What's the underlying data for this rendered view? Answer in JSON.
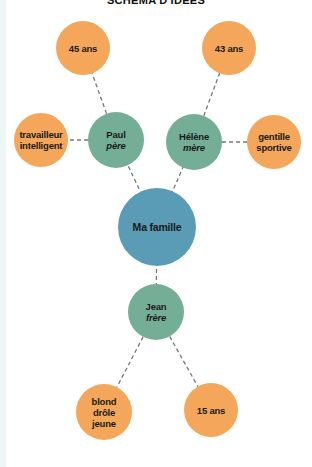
{
  "title": "SCHÉMA D'IDÉES",
  "colors": {
    "attribute": "#F4A75A",
    "person": "#74AE96",
    "center": "#5A9BB5",
    "link": "#777777"
  },
  "nodes": {
    "center": {
      "label": "Ma famille",
      "x": 157,
      "y": 227,
      "r": 39
    },
    "paul": {
      "label": "Paul",
      "role": "père",
      "x": 116,
      "y": 140,
      "r": 28
    },
    "helene": {
      "label": "Hélène",
      "role": "mère",
      "x": 194,
      "y": 142,
      "r": 28
    },
    "jean": {
      "label": "Jean",
      "role": "frère",
      "x": 156,
      "y": 312,
      "r": 28
    },
    "paul_age": {
      "line1": "45 ans",
      "x": 83,
      "y": 48,
      "r": 27
    },
    "paul_traits": {
      "line1": "travailleur",
      "line2": "intelligent",
      "x": 41,
      "y": 140,
      "r": 27
    },
    "helene_age": {
      "line1": "43 ans",
      "x": 229,
      "y": 48,
      "r": 27
    },
    "helene_traits": {
      "line1": "gentille",
      "line2": "sportive",
      "x": 274,
      "y": 142,
      "r": 27
    },
    "jean_traits": {
      "line1": "blond",
      "line2": "drôle",
      "line3": "jeune",
      "x": 104,
      "y": 412,
      "r": 28
    },
    "jean_age": {
      "line1": "15 ans",
      "x": 211,
      "y": 410,
      "r": 27
    }
  },
  "links": [
    [
      "center",
      "paul"
    ],
    [
      "center",
      "helene"
    ],
    [
      "center",
      "jean"
    ],
    [
      "paul",
      "paul_age"
    ],
    [
      "paul",
      "paul_traits"
    ],
    [
      "helene",
      "helene_age"
    ],
    [
      "helene",
      "helene_traits"
    ],
    [
      "jean",
      "jean_traits"
    ],
    [
      "jean",
      "jean_age"
    ]
  ]
}
